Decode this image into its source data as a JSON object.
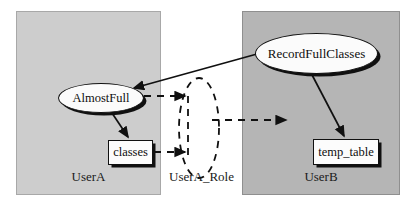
{
  "diagram": {
    "type": "node-link-diagram",
    "panels": [
      {
        "id": "usera",
        "label": "UserA",
        "fill": "#cdcdcd",
        "x": 16,
        "y": 11,
        "w": 145,
        "h": 184
      },
      {
        "id": "userb",
        "label": "UserB",
        "fill": "#b5b5b5",
        "x": 242,
        "y": 11,
        "w": 158,
        "h": 184
      }
    ],
    "role": {
      "id": "usera_role",
      "label": "UserA_Role",
      "shape": "dashed-ellipse"
    },
    "nodes": [
      {
        "id": "almostfull",
        "label": "AlmostFull",
        "shape": "ellipse",
        "panel": "usera"
      },
      {
        "id": "classes",
        "label": "classes",
        "shape": "rectangle",
        "panel": "usera"
      },
      {
        "id": "recordfullclasses",
        "label": "RecordFullClasses",
        "shape": "ellipse",
        "panel": "userb"
      },
      {
        "id": "temp_table",
        "label": "temp_table",
        "shape": "rectangle",
        "panel": "userb"
      }
    ],
    "edges": [
      {
        "from": "recordfullclasses",
        "to": "almostfull",
        "style": "solid",
        "arrow": "end"
      },
      {
        "from": "almostfull",
        "to": "classes",
        "style": "solid",
        "arrow": "end"
      },
      {
        "from": "recordfullclasses",
        "to": "temp_table",
        "style": "solid",
        "arrow": "end"
      },
      {
        "from": "almostfull",
        "to": "usera_role",
        "style": "dashed",
        "arrow": "end"
      },
      {
        "from": "classes",
        "to": "usera_role",
        "style": "dashed",
        "arrow": "end"
      },
      {
        "from": "usera_role",
        "to": "userb",
        "style": "dashed",
        "arrow": "end"
      }
    ],
    "colors": {
      "panel_left": "#cdcdcd",
      "panel_right": "#b5b5b5",
      "node_fill": "#fbfbfb",
      "stroke": "#111111",
      "background": "#ffffff"
    }
  }
}
